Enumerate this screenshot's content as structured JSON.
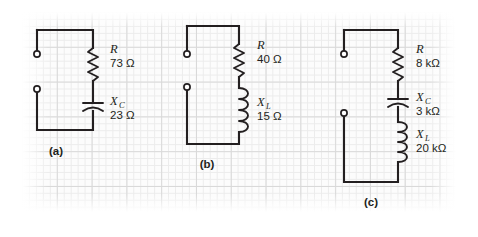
{
  "figure": {
    "type": "circuit-diagram",
    "background": "#fcfcfc",
    "ink_color": "#231f20",
    "grid_minor_color": "#ececec",
    "grid_major_color": "#d9d9d9"
  },
  "circuits": [
    {
      "panel_label": "(a)",
      "components": [
        {
          "kind": "resistor",
          "icon": "resistor-zigzag-icon",
          "symbol": "R",
          "subscript": "",
          "value": "73",
          "unit": "Ω",
          "value_text": "73 Ω"
        },
        {
          "kind": "capacitor",
          "icon": "capacitor-curved-icon",
          "symbol": "X",
          "subscript": "C",
          "value": "23",
          "unit": "Ω",
          "value_text": "23 Ω"
        }
      ]
    },
    {
      "panel_label": "(b)",
      "components": [
        {
          "kind": "resistor",
          "icon": "resistor-zigzag-icon",
          "symbol": "R",
          "subscript": "",
          "value": "40",
          "unit": "Ω",
          "value_text": "40 Ω"
        },
        {
          "kind": "inductor",
          "icon": "inductor-coil-icon",
          "symbol": "X",
          "subscript": "L",
          "value": "15",
          "unit": "Ω",
          "value_text": "15 Ω"
        }
      ]
    },
    {
      "panel_label": "(c)",
      "components": [
        {
          "kind": "resistor",
          "icon": "resistor-zigzag-icon",
          "symbol": "R",
          "subscript": "",
          "value": "8",
          "unit": "kΩ",
          "value_text": "8 kΩ"
        },
        {
          "kind": "capacitor",
          "icon": "capacitor-curved-icon",
          "symbol": "X",
          "subscript": "C",
          "value": "3",
          "unit": "kΩ",
          "value_text": "3 kΩ"
        },
        {
          "kind": "inductor",
          "icon": "inductor-coil-icon",
          "symbol": "X",
          "subscript": "L",
          "value": "20",
          "unit": "kΩ",
          "value_text": "20 kΩ"
        }
      ]
    }
  ]
}
